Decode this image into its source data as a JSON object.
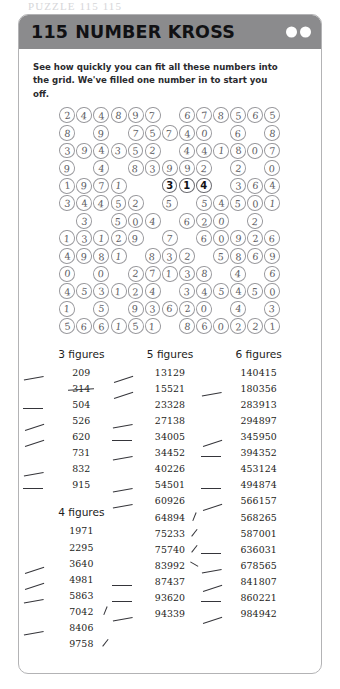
{
  "page": {
    "running_head": "PUZZLE 115  115"
  },
  "card": {
    "header": {
      "puzzle_number": "115",
      "title": "NUMBER KROSS",
      "dots": 2
    },
    "instructions": "See how quickly you can fit all these numbers into the grid. We've filled one number in to start you off."
  },
  "grid": {
    "columns": 13,
    "rows": 13,
    "cells": [
      [
        "2",
        "4",
        "4",
        "8",
        "9",
        "7",
        "",
        "6",
        "7",
        "8",
        "5",
        "6",
        "5"
      ],
      [
        "8",
        "",
        "9",
        "",
        "7",
        "5",
        "7",
        "4",
        "0",
        "",
        "6",
        "",
        "8"
      ],
      [
        "3",
        "9",
        "4",
        "3",
        "5",
        "2",
        "",
        "4",
        "4",
        "1",
        "8",
        "0",
        "7"
      ],
      [
        "9",
        "",
        "4",
        "",
        "8",
        "3",
        "9",
        "9",
        "2",
        "",
        "2",
        "",
        "0"
      ],
      [
        "1",
        "9",
        "7",
        "1",
        "",
        "",
        "3",
        "1",
        "4",
        "",
        "3",
        "6",
        "4",
        "0"
      ],
      [
        "3",
        "4",
        "4",
        "5",
        "2",
        "",
        "5",
        "",
        "5",
        "4",
        "5",
        "0",
        "1"
      ],
      [
        "",
        "3",
        "",
        "5",
        "0",
        "4",
        "",
        "6",
        "2",
        "0",
        "",
        "2",
        ""
      ],
      [
        "1",
        "3",
        "1",
        "2",
        "9",
        "",
        "7",
        "",
        "6",
        "0",
        "9",
        "2",
        "6"
      ],
      [
        "4",
        "9",
        "8",
        "1",
        "",
        "8",
        "3",
        "2",
        "",
        "5",
        "8",
        "6",
        "9"
      ],
      [
        "0",
        "",
        "0",
        "",
        "2",
        "7",
        "1",
        "3",
        "8",
        "",
        "4",
        "",
        "6"
      ],
      [
        "4",
        "5",
        "3",
        "1",
        "2",
        "4",
        "",
        "3",
        "4",
        "5",
        "4",
        "5",
        "0"
      ],
      [
        "1",
        "",
        "5",
        "",
        "9",
        "3",
        "6",
        "2",
        "0",
        "",
        "4",
        "",
        "3"
      ],
      [
        "5",
        "6",
        "6",
        "1",
        "5",
        "1",
        "",
        "8",
        "6",
        "0",
        "2",
        "2",
        "1"
      ]
    ],
    "given_number": "314",
    "given_row_index": 4,
    "given_col_start": 6
  },
  "lists": {
    "columns": [
      {
        "groups": [
          {
            "heading": "3 figures",
            "entries": [
              {
                "value": "209",
                "mark": "left-dash",
                "mark_style": "d1"
              },
              {
                "value": "314",
                "mark": "strike",
                "mark_style": ""
              },
              {
                "value": "504",
                "mark": "left-dash",
                "mark_style": "d0"
              },
              {
                "value": "526",
                "mark": "left-dash",
                "mark_style": "d2"
              },
              {
                "value": "620",
                "mark": "left-dash",
                "mark_style": "d2"
              },
              {
                "value": "731",
                "mark": "none",
                "mark_style": ""
              },
              {
                "value": "832",
                "mark": "left-dash",
                "mark_style": "d1"
              },
              {
                "value": "915",
                "mark": "left-dash",
                "mark_style": "d0"
              }
            ]
          },
          {
            "heading": "4 figures",
            "entries": [
              {
                "value": "1971",
                "mark": "none",
                "mark_style": ""
              },
              {
                "value": "2295",
                "mark": "none",
                "mark_style": ""
              },
              {
                "value": "3640",
                "mark": "left-dash",
                "mark_style": "d2"
              },
              {
                "value": "4981",
                "mark": "left-dash",
                "mark_style": "d2"
              },
              {
                "value": "5863",
                "mark": "left-dash",
                "mark_style": "d1"
              },
              {
                "value": "7042",
                "mark": "right-tick",
                "mark_style": "t0"
              },
              {
                "value": "8406",
                "mark": "left-dash",
                "mark_style": "d1"
              },
              {
                "value": "9758",
                "mark": "right-tick",
                "mark_style": "t1"
              }
            ]
          }
        ]
      },
      {
        "groups": [
          {
            "heading": "5 figures",
            "entries": [
              {
                "value": "13129",
                "mark": "left-dash",
                "mark_style": "d2"
              },
              {
                "value": "15521",
                "mark": "left-dash",
                "mark_style": "d2"
              },
              {
                "value": "23328",
                "mark": "none",
                "mark_style": ""
              },
              {
                "value": "27138",
                "mark": "left-dash",
                "mark_style": "d1"
              },
              {
                "value": "34005",
                "mark": "left-dash",
                "mark_style": "d0"
              },
              {
                "value": "34452",
                "mark": "left-dash",
                "mark_style": "d1"
              },
              {
                "value": "40226",
                "mark": "none",
                "mark_style": ""
              },
              {
                "value": "54501",
                "mark": "left-dash",
                "mark_style": "d1"
              },
              {
                "value": "60926",
                "mark": "left-dash",
                "mark_style": "d1"
              },
              {
                "value": "64894",
                "mark": "right-tick",
                "mark_style": "t0"
              },
              {
                "value": "75233",
                "mark": "right-tick",
                "mark_style": "t1"
              },
              {
                "value": "75740",
                "mark": "right-tick",
                "mark_style": "t1"
              },
              {
                "value": "83992",
                "mark": "right-tick",
                "mark_style": "t2"
              },
              {
                "value": "87437",
                "mark": "left-dash",
                "mark_style": "d0"
              },
              {
                "value": "93620",
                "mark": "left-dash",
                "mark_style": "d0"
              },
              {
                "value": "94339",
                "mark": "left-dash",
                "mark_style": "d1"
              }
            ]
          }
        ]
      },
      {
        "groups": [
          {
            "heading": "6 figures",
            "entries": [
              {
                "value": "140415",
                "mark": "none",
                "mark_style": ""
              },
              {
                "value": "180356",
                "mark": "left-dash",
                "mark_style": "d1"
              },
              {
                "value": "283913",
                "mark": "none",
                "mark_style": ""
              },
              {
                "value": "294897",
                "mark": "none",
                "mark_style": ""
              },
              {
                "value": "345950",
                "mark": "left-dash",
                "mark_style": "d2"
              },
              {
                "value": "394352",
                "mark": "left-dash",
                "mark_style": "d0"
              },
              {
                "value": "453124",
                "mark": "none",
                "mark_style": ""
              },
              {
                "value": "494874",
                "mark": "left-dash",
                "mark_style": "d0"
              },
              {
                "value": "566157",
                "mark": "left-dash",
                "mark_style": "d2"
              },
              {
                "value": "568265",
                "mark": "none",
                "mark_style": ""
              },
              {
                "value": "587001",
                "mark": "none",
                "mark_style": ""
              },
              {
                "value": "636031",
                "mark": "left-dash",
                "mark_style": "d0"
              },
              {
                "value": "678565",
                "mark": "left-dash",
                "mark_style": "d1"
              },
              {
                "value": "841807",
                "mark": "left-dash",
                "mark_style": "d2"
              },
              {
                "value": "860221",
                "mark": "left-dash",
                "mark_style": "d0"
              },
              {
                "value": "984942",
                "mark": "left-dash",
                "mark_style": "d2"
              }
            ]
          }
        ]
      }
    ]
  },
  "colors": {
    "header_bar": "#8b8b8d",
    "card_border": "#b3b3b5",
    "pencil": "#5c5c62",
    "ink": "#1d1d21"
  }
}
